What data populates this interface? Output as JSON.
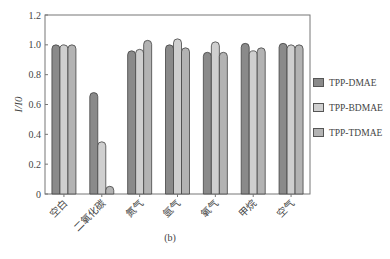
{
  "chart_data": {
    "type": "bar",
    "title": "",
    "xlabel": "",
    "ylabel": "I/I0",
    "ylim": [
      0,
      1.2
    ],
    "yticks": [
      "0",
      "0.2",
      "0.4",
      "0.6",
      "0.8",
      "1.0",
      "1.2"
    ],
    "categories": [
      "空白",
      "二氧化碳",
      "氮气",
      "氩气",
      "氧气",
      "甲烷",
      "空气"
    ],
    "series": [
      {
        "name": "TPP-DMAE",
        "color": "#8a8a8a",
        "values": [
          1.0,
          0.68,
          0.96,
          1.0,
          0.95,
          1.01,
          1.01
        ]
      },
      {
        "name": "TPP-BDMAE",
        "color": "#cfcfcf",
        "values": [
          1.0,
          0.35,
          0.97,
          1.04,
          1.02,
          0.96,
          1.0
        ]
      },
      {
        "name": "TPP-TDMAE",
        "color": "#b3b3b3",
        "values": [
          1.0,
          0.05,
          1.03,
          0.98,
          0.95,
          0.98,
          1.0
        ]
      }
    ],
    "legend_position": "right",
    "grid": false,
    "caption": "(b)"
  }
}
